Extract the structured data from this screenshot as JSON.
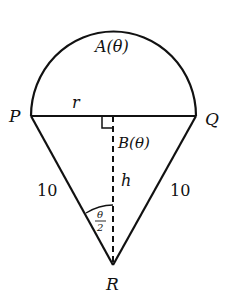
{
  "diagram": {
    "type": "geometry-figure",
    "colors": {
      "stroke": "#111111",
      "background": "#ffffff"
    },
    "labels": {
      "area_semicircle": "A(θ)",
      "radius": "r",
      "point_p": "P",
      "point_q": "Q",
      "point_r": "R",
      "area_triangle": "B(θ)",
      "height": "h",
      "side_left": "10",
      "side_right": "10",
      "angle_num": "θ",
      "angle_den": "2"
    }
  }
}
